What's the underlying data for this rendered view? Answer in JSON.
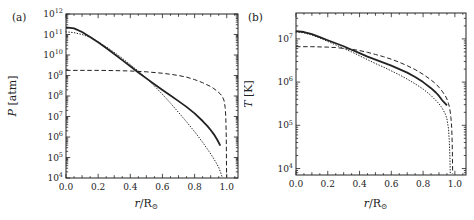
{
  "figure": {
    "background": "#ffffff",
    "ink": "#222222"
  },
  "chart_data": [
    {
      "type": "line",
      "title": "",
      "panel_label": "(a)",
      "ylabel": {
        "var": "P",
        "rest": " [atm]"
      },
      "xlabel": {
        "var": "r",
        "rest": "/R",
        "sub": "⊙"
      },
      "y_scale": "log10",
      "y_tick_base": "10",
      "ylim_exp": [
        4,
        12
      ],
      "y_tick_exps": [
        "4",
        "5",
        "6",
        "7",
        "8",
        "9",
        "10",
        "11",
        "12"
      ],
      "xlim": [
        0,
        1.07
      ],
      "x_tick_values": [
        0,
        0.2,
        0.4,
        0.6,
        0.8,
        1.0
      ],
      "x_tick_labels": [
        "0.0",
        "0.2",
        "0.4",
        "0.6",
        "0.8",
        "1.0"
      ],
      "grid": false,
      "legend": "none",
      "series": [
        {
          "name": "solid-curve",
          "line_style": "solid",
          "points_log": [
            [
              0,
              11.35
            ],
            [
              0.05,
              11.3
            ],
            [
              0.1,
              11.12
            ],
            [
              0.15,
              10.88
            ],
            [
              0.2,
              10.62
            ],
            [
              0.25,
              10.34
            ],
            [
              0.3,
              10.05
            ],
            [
              0.35,
              9.75
            ],
            [
              0.4,
              9.45
            ],
            [
              0.45,
              9.15
            ],
            [
              0.5,
              8.86
            ],
            [
              0.55,
              8.57
            ],
            [
              0.6,
              8.29
            ],
            [
              0.65,
              8.02
            ],
            [
              0.7,
              7.75
            ],
            [
              0.75,
              7.47
            ],
            [
              0.8,
              7.15
            ],
            [
              0.85,
              6.78
            ],
            [
              0.88,
              6.53
            ],
            [
              0.9,
              6.34
            ],
            [
              0.92,
              6.13
            ],
            [
              0.94,
              5.88
            ],
            [
              0.96,
              5.58
            ]
          ]
        },
        {
          "name": "dotted-curve",
          "line_style": "dotted",
          "points_log": [
            [
              0,
              11.13
            ],
            [
              0.05,
              11.09
            ],
            [
              0.1,
              11.0
            ],
            [
              0.15,
              10.86
            ],
            [
              0.2,
              10.64
            ],
            [
              0.25,
              10.4
            ],
            [
              0.3,
              10.13
            ],
            [
              0.35,
              9.84
            ],
            [
              0.4,
              9.53
            ],
            [
              0.45,
              9.21
            ],
            [
              0.5,
              8.87
            ],
            [
              0.55,
              8.49
            ],
            [
              0.6,
              8.08
            ],
            [
              0.65,
              7.65
            ],
            [
              0.7,
              7.2
            ],
            [
              0.75,
              6.74
            ],
            [
              0.8,
              6.26
            ],
            [
              0.85,
              5.74
            ],
            [
              0.9,
              5.18
            ],
            [
              0.93,
              4.8
            ],
            [
              0.95,
              4.52
            ],
            [
              0.965,
              4.2
            ],
            [
              0.972,
              4.02
            ]
          ]
        },
        {
          "name": "dashed-curve",
          "line_style": "dashed",
          "points_log": [
            [
              0,
              9.25
            ],
            [
              0.1,
              9.25
            ],
            [
              0.2,
              9.25
            ],
            [
              0.3,
              9.24
            ],
            [
              0.4,
              9.22
            ],
            [
              0.5,
              9.18
            ],
            [
              0.6,
              9.11
            ],
            [
              0.65,
              9.06
            ],
            [
              0.7,
              9.0
            ],
            [
              0.75,
              8.92
            ],
            [
              0.8,
              8.8
            ],
            [
              0.85,
              8.65
            ],
            [
              0.9,
              8.46
            ],
            [
              0.92,
              8.36
            ],
            [
              0.94,
              8.24
            ],
            [
              0.96,
              8.1
            ],
            [
              0.97,
              8.0
            ],
            [
              0.98,
              7.85
            ],
            [
              0.985,
              7.72
            ],
            [
              0.99,
              7.45
            ],
            [
              0.994,
              7.0
            ],
            [
              0.997,
              6.0
            ],
            [
              0.999,
              4.05
            ]
          ]
        }
      ]
    },
    {
      "type": "line",
      "title": "",
      "panel_label": "(b)",
      "ylabel": {
        "var": "T",
        "rest": " [K]"
      },
      "xlabel": {
        "var": "r",
        "rest": "/R",
        "sub": "⊙"
      },
      "y_scale": "log10",
      "y_tick_base": "10",
      "ylim_exp": [
        3.85,
        7.6
      ],
      "y_tick_exps": [
        "4",
        "5",
        "6",
        "7"
      ],
      "xlim": [
        0,
        1.07
      ],
      "x_tick_values": [
        0,
        0.2,
        0.4,
        0.6,
        0.8,
        1.0
      ],
      "x_tick_labels": [
        "0.0",
        "0.2",
        "0.4",
        "0.6",
        "0.8",
        "1.0"
      ],
      "grid": false,
      "legend": "none",
      "series": [
        {
          "name": "solid-curve",
          "line_style": "solid",
          "points_log": [
            [
              0,
              7.18
            ],
            [
              0.05,
              7.16
            ],
            [
              0.1,
              7.11
            ],
            [
              0.15,
              7.04
            ],
            [
              0.2,
              6.97
            ],
            [
              0.25,
              6.9
            ],
            [
              0.3,
              6.83
            ],
            [
              0.35,
              6.75
            ],
            [
              0.4,
              6.67
            ],
            [
              0.45,
              6.59
            ],
            [
              0.5,
              6.52
            ],
            [
              0.55,
              6.45
            ],
            [
              0.6,
              6.38
            ],
            [
              0.65,
              6.3
            ],
            [
              0.7,
              6.22
            ],
            [
              0.75,
              6.12
            ],
            [
              0.8,
              6.0
            ],
            [
              0.85,
              5.86
            ],
            [
              0.88,
              5.76
            ],
            [
              0.9,
              5.68
            ],
            [
              0.92,
              5.58
            ],
            [
              0.94,
              5.5
            ],
            [
              0.95,
              5.46
            ]
          ]
        },
        {
          "name": "dotted-curve",
          "line_style": "dotted",
          "points_log": [
            [
              0,
              7.16
            ],
            [
              0.05,
              7.14
            ],
            [
              0.1,
              7.09
            ],
            [
              0.15,
              7.02
            ],
            [
              0.2,
              6.94
            ],
            [
              0.25,
              6.86
            ],
            [
              0.3,
              6.78
            ],
            [
              0.35,
              6.7
            ],
            [
              0.4,
              6.61
            ],
            [
              0.45,
              6.52
            ],
            [
              0.5,
              6.43
            ],
            [
              0.55,
              6.35
            ],
            [
              0.6,
              6.26
            ],
            [
              0.65,
              6.17
            ],
            [
              0.7,
              6.07
            ],
            [
              0.75,
              5.96
            ],
            [
              0.8,
              5.84
            ],
            [
              0.85,
              5.69
            ],
            [
              0.9,
              5.5
            ],
            [
              0.92,
              5.4
            ],
            [
              0.94,
              5.26
            ],
            [
              0.95,
              5.15
            ],
            [
              0.96,
              4.92
            ],
            [
              0.965,
              4.62
            ],
            [
              0.969,
              4.25
            ],
            [
              0.971,
              3.88
            ]
          ]
        },
        {
          "name": "dashed-curve",
          "line_style": "dashed",
          "points_log": [
            [
              0,
              6.82
            ],
            [
              0.1,
              6.82
            ],
            [
              0.2,
              6.81
            ],
            [
              0.25,
              6.8
            ],
            [
              0.3,
              6.78
            ],
            [
              0.35,
              6.76
            ],
            [
              0.4,
              6.73
            ],
            [
              0.45,
              6.69
            ],
            [
              0.5,
              6.64
            ],
            [
              0.55,
              6.59
            ],
            [
              0.6,
              6.53
            ],
            [
              0.65,
              6.46
            ],
            [
              0.7,
              6.38
            ],
            [
              0.75,
              6.29
            ],
            [
              0.8,
              6.18
            ],
            [
              0.85,
              6.05
            ],
            [
              0.88,
              5.96
            ],
            [
              0.9,
              5.88
            ],
            [
              0.92,
              5.79
            ],
            [
              0.94,
              5.68
            ],
            [
              0.95,
              5.61
            ],
            [
              0.96,
              5.5
            ],
            [
              0.965,
              5.43
            ],
            [
              0.97,
              5.33
            ],
            [
              0.975,
              5.18
            ],
            [
              0.98,
              4.95
            ],
            [
              0.983,
              4.6
            ],
            [
              0.985,
              4.2
            ],
            [
              0.986,
              3.88
            ]
          ]
        }
      ]
    }
  ]
}
